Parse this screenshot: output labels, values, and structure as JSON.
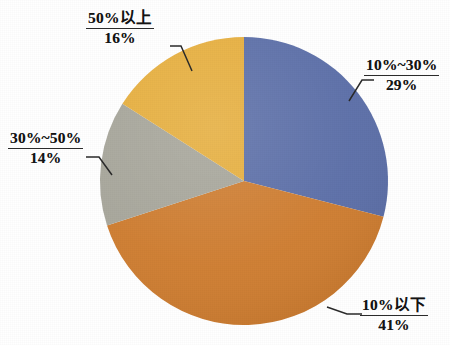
{
  "chart_data": {
    "type": "pie",
    "title": "",
    "subtitle": "",
    "xlabel": "",
    "ylabel": "",
    "grid": false,
    "legend_position": "none",
    "label_style": "callout-with-leader-line",
    "start_angle_deg": 0,
    "direction": "clockwise",
    "categories": [
      "10%~30%",
      "10%以下",
      "30%~50%",
      "50%以上"
    ],
    "values": [
      29,
      41,
      14,
      16
    ],
    "value_unit": "%",
    "colors": [
      "#5c6fa8",
      "#cf7d30",
      "#a7a69b",
      "#e7af3e"
    ],
    "slices": [
      {
        "label": "10%~30%",
        "value": 29,
        "value_text": "29%",
        "color": "#5c6fa8",
        "start_deg": 0,
        "end_deg": 104.4,
        "callout_position": "right-top"
      },
      {
        "label": "10%以下",
        "value": 41,
        "value_text": "41%",
        "color": "#cf7d30",
        "start_deg": 104.4,
        "end_deg": 252.0,
        "callout_position": "right-bottom"
      },
      {
        "label": "30%~50%",
        "value": 14,
        "value_text": "14%",
        "color": "#a7a69b",
        "start_deg": 252.0,
        "end_deg": 302.4,
        "callout_position": "left-middle"
      },
      {
        "label": "50%以上",
        "value": 16,
        "value_text": "16%",
        "color": "#e7af3e",
        "start_deg": 302.4,
        "end_deg": 360.0,
        "callout_position": "left-top"
      }
    ]
  },
  "labels": {
    "over50": {
      "category": "50%以上",
      "value": "16%"
    },
    "range10to30": {
      "category": "10%~30%",
      "value": "29%"
    },
    "range30to50": {
      "category": "30%~50%",
      "value": "14%"
    },
    "under10": {
      "category": "10%以下",
      "value": "41%"
    }
  },
  "palette": {
    "blue": "#5c6fa8",
    "orange": "#cf7d30",
    "gray": "#a7a69b",
    "gold": "#e7af3e",
    "leader_line": "#2b2b2b",
    "background": "#ffffff",
    "text": "#141414"
  }
}
